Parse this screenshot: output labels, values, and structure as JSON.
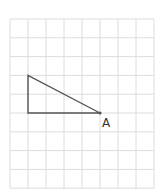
{
  "diagram": {
    "grid": {
      "columns": 8,
      "rows": 9,
      "origin_x": 10,
      "origin_y": 19,
      "cell_w": 18,
      "cell_h": 18.8,
      "line_color": "#dcdcdc"
    },
    "triangle": {
      "stroke": "#555555",
      "vertices_grid": [
        [
          1,
          3
        ],
        [
          1,
          5
        ],
        [
          5,
          5
        ]
      ]
    },
    "point_label": {
      "text": "A",
      "vertex_grid": [
        5,
        5
      ]
    }
  }
}
